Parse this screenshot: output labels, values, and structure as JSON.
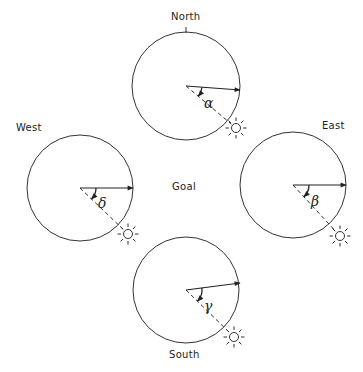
{
  "diagram": {
    "center_label": "Goal",
    "colors": {
      "stroke": "#333333",
      "text": "#222222",
      "background": "#ffffff"
    },
    "panels": [
      {
        "id": "north",
        "direction_label": "North",
        "angle_symbol": "α",
        "circle": {
          "cx": 186,
          "cy": 86,
          "r": 54
        },
        "heading_end": {
          "x": 240,
          "y": 90
        },
        "sun": {
          "x": 236,
          "y": 128
        },
        "label_pos": {
          "x": 171,
          "y": 20
        },
        "angle_label_pos": {
          "x": 204,
          "y": 108
        },
        "has_top_tick": true
      },
      {
        "id": "west",
        "direction_label": "West",
        "angle_symbol": "δ",
        "circle": {
          "cx": 80,
          "cy": 188,
          "r": 53
        },
        "heading_end": {
          "x": 133,
          "y": 188
        },
        "sun": {
          "x": 128,
          "y": 234
        },
        "label_pos": {
          "x": 16,
          "y": 131
        },
        "angle_label_pos": {
          "x": 98,
          "y": 208
        },
        "has_top_tick": false
      },
      {
        "id": "east",
        "direction_label": "East",
        "angle_symbol": "β",
        "circle": {
          "cx": 293,
          "cy": 185,
          "r": 53
        },
        "heading_end": {
          "x": 346,
          "y": 185
        },
        "sun": {
          "x": 340,
          "y": 236
        },
        "label_pos": {
          "x": 322,
          "y": 129
        },
        "angle_label_pos": {
          "x": 311,
          "y": 206
        },
        "has_top_tick": false
      },
      {
        "id": "south",
        "direction_label": "South",
        "angle_symbol": "γ",
        "circle": {
          "cx": 186,
          "cy": 290,
          "r": 53
        },
        "heading_end": {
          "x": 240,
          "y": 283
        },
        "sun": {
          "x": 234,
          "y": 337
        },
        "label_pos": {
          "x": 169,
          "y": 358
        },
        "angle_label_pos": {
          "x": 204,
          "y": 311
        },
        "has_top_tick": false
      }
    ]
  }
}
